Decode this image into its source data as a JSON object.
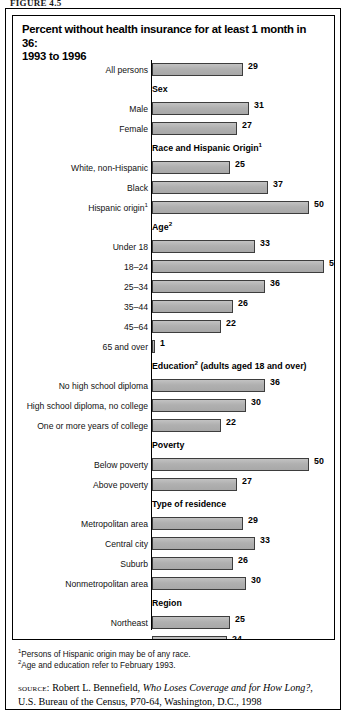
{
  "figure_label": "FIGURE 4.5",
  "title": {
    "line1": "Percent without health insurance for at least 1 month in 36:",
    "line2": "1993 to 1996"
  },
  "chart_data": {
    "type": "bar",
    "orientation": "horizontal",
    "title": "Percent without health insurance for at least 1 month in 36: 1993 to 1996",
    "xlabel": "",
    "ylabel": "",
    "xlim": [
      0,
      55
    ],
    "grid": false,
    "legend": null,
    "value_suffix": "",
    "categories": [
      "All persons",
      "Male",
      "Female",
      "White, non-Hispanic",
      "Black",
      "Hispanic origin",
      "Under 18",
      "18–24",
      "25–34",
      "35–44",
      "45–64",
      "65 and over",
      "No high school diploma",
      "High school diploma, no college",
      "One or more years of college",
      "Below poverty",
      "Above poverty",
      "Metropolitan area",
      "Central city",
      "Suburb",
      "Nonmetropolitan area",
      "Northeast",
      "Midwest",
      "South",
      "West"
    ],
    "values": [
      29,
      31,
      27,
      25,
      37,
      50,
      33,
      55,
      36,
      26,
      22,
      1,
      36,
      30,
      22,
      50,
      27,
      29,
      33,
      26,
      30,
      25,
      24,
      34,
      31
    ],
    "groups": [
      {
        "header": "",
        "header_sup": "",
        "rows": [
          {
            "label": "All persons",
            "label_sup": "",
            "value": 29
          }
        ]
      },
      {
        "header": "Sex",
        "header_sup": "",
        "rows": [
          {
            "label": "Male",
            "label_sup": "",
            "value": 31
          },
          {
            "label": "Female",
            "label_sup": "",
            "value": 27
          }
        ]
      },
      {
        "header": "Race and Hispanic Origin",
        "header_sup": "1",
        "rows": [
          {
            "label": "White, non-Hispanic",
            "label_sup": "",
            "value": 25
          },
          {
            "label": "Black",
            "label_sup": "",
            "value": 37
          },
          {
            "label": "Hispanic origin",
            "label_sup": "1",
            "value": 50
          }
        ]
      },
      {
        "header": "Age",
        "header_sup": "2",
        "rows": [
          {
            "label": "Under 18",
            "label_sup": "",
            "value": 33
          },
          {
            "label": "18–24",
            "label_sup": "",
            "value": 55
          },
          {
            "label": "25–34",
            "label_sup": "",
            "value": 36
          },
          {
            "label": "35–44",
            "label_sup": "",
            "value": 26
          },
          {
            "label": "45–64",
            "label_sup": "",
            "value": 22
          },
          {
            "label": "65 and over",
            "label_sup": "",
            "value": 1
          }
        ]
      },
      {
        "header": "Education",
        "header_sup": "2",
        "header_tail": " (adults aged 18 and over)",
        "rows": [
          {
            "label": "No high school diploma",
            "label_sup": "",
            "value": 36
          },
          {
            "label": "High school diploma, no college",
            "label_sup": "",
            "value": 30
          },
          {
            "label": "One or more years of college",
            "label_sup": "",
            "value": 22
          }
        ]
      },
      {
        "header": "Poverty",
        "header_sup": "",
        "rows": [
          {
            "label": "Below poverty",
            "label_sup": "",
            "value": 50
          },
          {
            "label": "Above poverty",
            "label_sup": "",
            "value": 27
          }
        ]
      },
      {
        "header": "Type of residence",
        "header_sup": "",
        "rows": [
          {
            "label": "Metropolitan area",
            "label_sup": "",
            "value": 29
          },
          {
            "label": "Central city",
            "label_sup": "",
            "value": 33
          },
          {
            "label": "Suburb",
            "label_sup": "",
            "value": 26
          },
          {
            "label": "Nonmetropolitan area",
            "label_sup": "",
            "value": 30
          }
        ]
      },
      {
        "header": "Region",
        "header_sup": "",
        "rows": [
          {
            "label": "Northeast",
            "label_sup": "",
            "value": 25
          },
          {
            "label": "Midwest",
            "label_sup": "",
            "value": 24
          },
          {
            "label": "South",
            "label_sup": "",
            "value": 34
          },
          {
            "label": "West",
            "label_sup": "",
            "value": 31
          }
        ]
      }
    ]
  },
  "footnotes": [
    {
      "marker": "1",
      "text": "Persons of Hispanic origin may be of any race."
    },
    {
      "marker": "2",
      "text": "Age and education refer to February 1993."
    }
  ],
  "source": {
    "label": "source:",
    "author": " Robert L. Bennefield, ",
    "work": "Who Loses Coverage and for How Long?",
    "rest": ", U.S. Bureau of the Census, P70-64, Washington, D.C., 1998"
  },
  "colors": {
    "bar_fill": "#b3b3b3",
    "bar_border": "#3d3d3d",
    "frame": "#000000",
    "text": "#000000"
  }
}
